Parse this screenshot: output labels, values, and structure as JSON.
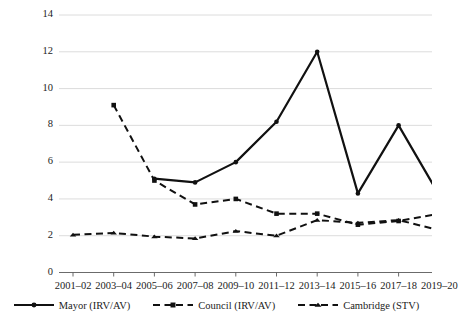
{
  "chart_data": {
    "type": "line",
    "title": "",
    "subtitle": "",
    "xlabel": "",
    "ylabel": "",
    "categories": [
      "2001–02",
      "2003–04",
      "2005–06",
      "2007–08",
      "2009–10",
      "2011–12",
      "2013–14",
      "2015–16",
      "2017–18",
      "2019–20"
    ],
    "ylim": [
      0,
      14
    ],
    "ytick_labels": [
      "0",
      "2",
      "4",
      "6",
      "8",
      "10",
      "12",
      "14"
    ],
    "ytick_values": [
      0,
      2,
      4,
      6,
      8,
      10,
      12,
      14
    ],
    "grid": true,
    "grid_axis": "y",
    "legend_position": "bottom",
    "series": [
      {
        "name": "Mayor (IRV/AV)",
        "marker": "circle",
        "linestyle": "solid",
        "color": "#111111",
        "values": [
          null,
          null,
          5.1,
          4.9,
          6.0,
          8.2,
          12.0,
          4.3,
          8.0,
          4.2
        ]
      },
      {
        "name": "Council (IRV/AV)",
        "marker": "square",
        "linestyle": "dashed",
        "color": "#111111",
        "values": [
          null,
          9.1,
          5.0,
          3.7,
          4.0,
          3.2,
          3.2,
          2.6,
          2.8,
          3.2
        ]
      },
      {
        "name": "Cambridge (STV)",
        "marker": "triangle",
        "linestyle": "dashed",
        "color": "#111111",
        "values": [
          2.05,
          2.15,
          1.95,
          1.85,
          2.25,
          2.0,
          2.85,
          2.7,
          2.85,
          2.3
        ]
      }
    ]
  },
  "axis": {
    "y_axis_name": "value-axis",
    "x_axis_name": "period-axis"
  },
  "legend": {
    "items": [
      {
        "label": "Mayor (IRV/AV)",
        "marker": "circle",
        "linestyle": "solid"
      },
      {
        "label": "Council (IRV/AV)",
        "marker": "square",
        "linestyle": "dashed"
      },
      {
        "label": "Cambridge (STV)",
        "marker": "triangle",
        "linestyle": "dashed"
      }
    ]
  }
}
